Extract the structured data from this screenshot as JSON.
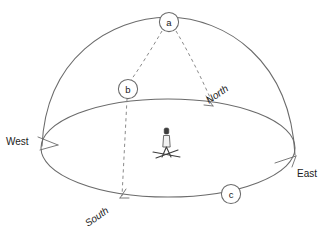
{
  "figure": {
    "background_color": "#ffffff",
    "line_color": "#6b6b6b",
    "dashed_color": "#8a8a8a",
    "text_color": "#1a1a1a"
  },
  "nodes": [
    {
      "id": "a",
      "label": "a",
      "cx": 169,
      "cy": 22,
      "r": 10
    },
    {
      "id": "b",
      "label": "b",
      "cx": 128,
      "cy": 89,
      "r": 10
    },
    {
      "id": "c",
      "label": "c",
      "cx": 231,
      "cy": 194,
      "r": 10
    }
  ],
  "cardinals": {
    "west": {
      "label": "West",
      "x": 6,
      "y": 141,
      "rotation": 0
    },
    "east": {
      "label": "East",
      "x": 298,
      "y": 173,
      "rotation": 0
    },
    "north": {
      "label": "North",
      "x": 208,
      "y": 104,
      "rotation": -35
    },
    "south": {
      "label": "South",
      "x": 88,
      "y": 226,
      "rotation": -35
    }
  },
  "observer": {
    "name": "observer-figure",
    "x": 166,
    "y": 150
  },
  "geometry": {
    "horizon_ellipse": {
      "cx": 168,
      "cy": 148,
      "rx": 127,
      "ry": 49
    },
    "dome_arc": "M 42,146 C 48,52 112,18 168,17 C 224,18 289,58 295,155",
    "dashed_meridian_north": "M 175,31 C 188,52 200,76 211,101",
    "dashed_arc_a_to_b": "M 161,31 C 150,48 138,68 130,80",
    "dashed_vertical_b_south": "M 127,99 L 121,197"
  }
}
